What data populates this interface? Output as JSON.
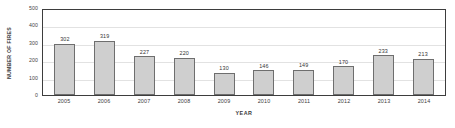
{
  "chart_data": {
    "type": "bar",
    "title": "",
    "xlabel": "YEAR",
    "ylabel": "NUMBER OF FIRES",
    "categories": [
      "2005",
      "2006",
      "2007",
      "2008",
      "2009",
      "2010",
      "2011",
      "2012",
      "2013",
      "2014"
    ],
    "values": [
      302,
      319,
      227,
      220,
      130,
      146,
      149,
      170,
      233,
      213
    ],
    "value_labels": [
      "302",
      "319",
      "227",
      "220",
      "130",
      "146",
      "149",
      "170",
      "233",
      "213"
    ],
    "ylim": [
      0,
      500
    ],
    "ytick_values": [
      0,
      100,
      200,
      300,
      400,
      500
    ],
    "ytick_labels": [
      "0",
      "100",
      "200",
      "300",
      "400",
      "500"
    ],
    "grid": true,
    "legend": "none",
    "series": [
      {
        "name": "Number of fires",
        "values": [
          302,
          319,
          227,
          220,
          130,
          146,
          149,
          170,
          233,
          213
        ]
      }
    ],
    "colors": {
      "bar_fill": "#cfcfcf",
      "bar_border": "#6e6e6e",
      "frame": "#3d3d3d",
      "gridline": "#e2e2e2",
      "text": "#3a3a3a",
      "background": "#ffffff"
    }
  }
}
